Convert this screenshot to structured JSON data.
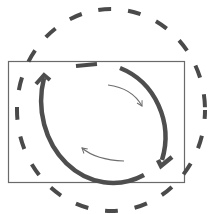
{
  "diagram": {
    "title": "",
    "colors": {
      "background": "#ffffff",
      "frame": "#6a6a6a",
      "dashed_circle": "#4a4a4a",
      "thick_arrows": "#4e4e4e",
      "thin_arrows": "#6e6e6e"
    },
    "elements": [
      {
        "name": "frame-rectangle",
        "kind": "rectangle"
      },
      {
        "name": "dashed-circle",
        "kind": "dashed-ellipse"
      },
      {
        "name": "thick-arrow-upper-right",
        "kind": "arc-arrow",
        "direction": "clockwise"
      },
      {
        "name": "thick-arrow-lower-left",
        "kind": "arc-arrow",
        "direction": "clockwise"
      },
      {
        "name": "thin-arrow-upper",
        "kind": "arc-arrow",
        "direction": "clockwise"
      },
      {
        "name": "thin-arrow-lower",
        "kind": "arc-arrow",
        "direction": "clockwise"
      }
    ]
  }
}
